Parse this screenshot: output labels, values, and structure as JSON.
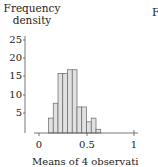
{
  "chart_data": {
    "type": "bar",
    "title": "",
    "xlabel": "Means of 4 observati...",
    "ylabel": "Frequency density",
    "ylim": [
      0,
      25
    ],
    "xlim": [
      0,
      1
    ],
    "y_ticks": [
      "5",
      "10",
      "15",
      "20",
      "25"
    ],
    "x_ticks": [
      "0",
      "0.5",
      "1"
    ],
    "bin_width": 0.05,
    "categories": [
      "0.10-0.15",
      "0.15-0.20",
      "0.20-0.25",
      "0.25-0.30",
      "0.30-0.35",
      "0.35-0.40",
      "0.40-0.45",
      "0.45-0.50",
      "0.50-0.55",
      "0.55-0.60",
      "0.60-0.65"
    ],
    "bin_starts": [
      0.1,
      0.15,
      0.2,
      0.25,
      0.3,
      0.35,
      0.4,
      0.45,
      0.5,
      0.55,
      0.6
    ],
    "values": [
      4,
      8,
      16,
      16,
      17,
      17,
      7,
      7,
      3,
      4,
      1
    ],
    "grid": false,
    "legend": null
  },
  "labels": {
    "ylabel_line1": "Frequency",
    "ylabel_line2": "density",
    "xlabel": "Means of 4 observati",
    "right_panel_fragment": "F"
  }
}
